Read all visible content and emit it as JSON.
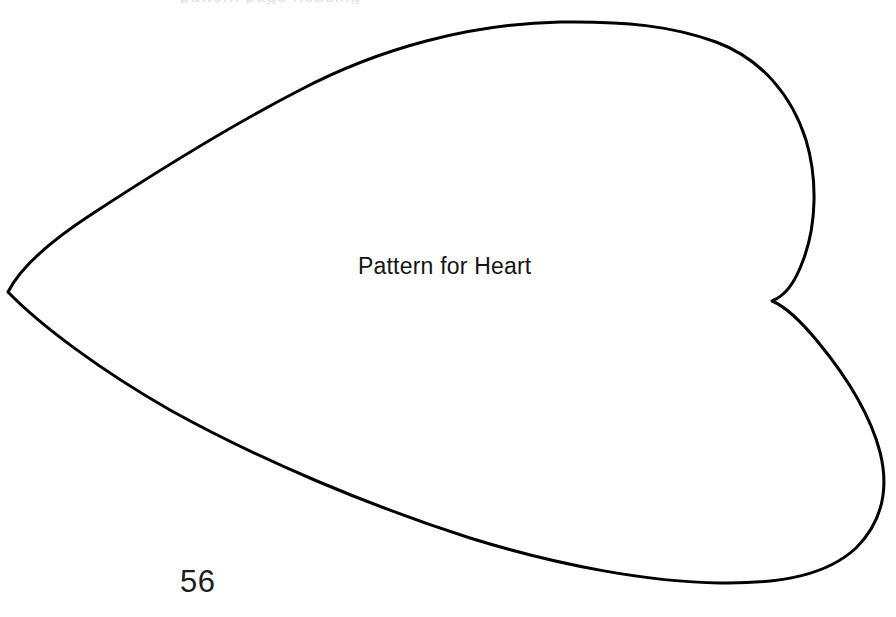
{
  "page": {
    "background_color": "#ffffff",
    "width": 896,
    "height": 617
  },
  "pattern": {
    "label": "Pattern for Heart",
    "shape_name": "heart-outline",
    "orientation": "rotated-left-point",
    "stroke_color": "#000000",
    "stroke_width": 3,
    "fill": "none",
    "outline_path": "M 8 292 C 20 268 52 240 92 214 C 150 176 230 126 300 90 C 380 48 470 24 560 22 C 625 21 672 26 716 42 C 762 59 792 96 806 140 C 818 180 816 225 804 258 C 794 286 784 296 772 301 C 784 306 800 320 818 342 C 846 376 870 414 880 452 C 890 492 880 524 856 548 C 828 574 784 584 720 583 C 650 582 560 566 470 538 C 370 506 260 460 170 410 C 100 370 40 325 8 292 Z",
    "left_point": [
      8,
      292
    ],
    "cleft_notch": [
      772,
      301
    ],
    "upper_lobe_apex": [
      660,
      22
    ],
    "right_extent": [
      886,
      470
    ],
    "bottom_extent": [
      715,
      583
    ]
  },
  "footer": {
    "page_number": "56"
  },
  "artifacts": {
    "top_cropped_text": "pattern page heading"
  }
}
